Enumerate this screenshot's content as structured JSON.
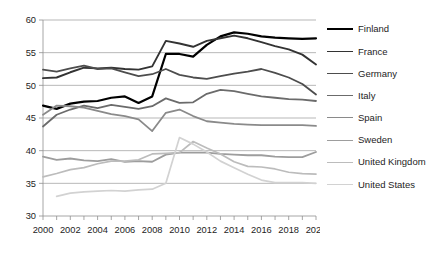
{
  "chart_data": {
    "type": "line",
    "title": "",
    "subtitle": "",
    "xlabel": "",
    "ylabel": "",
    "xlim": [
      2000,
      2020
    ],
    "ylim": [
      30,
      60
    ],
    "yticks": [
      30,
      35,
      40,
      45,
      50,
      55,
      60
    ],
    "xticks": [
      2000,
      2001,
      2002,
      2003,
      2004,
      2005,
      2006,
      2007,
      2008,
      2009,
      2010,
      2011,
      2012,
      2013,
      2014,
      2015,
      2016,
      2017,
      2018,
      2019,
      2020
    ],
    "xtick_labels": [
      "2000",
      "2002",
      "2004",
      "2006",
      "2008",
      "2010",
      "2012",
      "2014",
      "2016",
      "2018",
      "2020"
    ],
    "grid": "horizontal",
    "legend_position": "right",
    "x": [
      2000,
      2001,
      2002,
      2003,
      2004,
      2005,
      2006,
      2007,
      2008,
      2009,
      2010,
      2011,
      2012,
      2013,
      2014,
      2015,
      2016,
      2017,
      2018,
      2019,
      2020
    ],
    "series": [
      {
        "name": "Finland",
        "color": "#000000",
        "width": 2.2,
        "values": [
          46.9,
          46.4,
          47.2,
          47.5,
          47.6,
          48.1,
          48.3,
          47.3,
          48.3,
          54.8,
          54.8,
          54.4,
          56.2,
          57.5,
          58.1,
          57.9,
          57.5,
          57.3,
          57.2,
          57.1,
          57.2
        ]
      },
      {
        "name": "France",
        "color": "#333333",
        "width": 1.9,
        "values": [
          51.1,
          51.2,
          52.0,
          52.7,
          52.6,
          52.7,
          52.5,
          52.4,
          52.9,
          56.8,
          56.4,
          55.9,
          56.8,
          57.2,
          57.6,
          57.2,
          56.6,
          56.0,
          55.5,
          54.7,
          53.2
        ]
      },
      {
        "name": "Germany",
        "color": "#4d4d4d",
        "width": 1.8,
        "values": [
          52.4,
          52.1,
          52.6,
          53.0,
          52.5,
          52.6,
          52.0,
          51.4,
          51.7,
          52.5,
          51.6,
          51.2,
          51.0,
          51.4,
          51.8,
          52.1,
          52.5,
          51.9,
          51.2,
          50.2,
          48.6
        ]
      },
      {
        "name": "Italy",
        "color": "#6b6b6b",
        "width": 1.8,
        "values": [
          43.7,
          45.5,
          46.3,
          46.9,
          46.5,
          47.0,
          46.7,
          46.4,
          46.8,
          48.0,
          47.3,
          47.4,
          48.7,
          49.3,
          49.1,
          48.7,
          48.3,
          48.1,
          47.9,
          47.8,
          47.6
        ]
      },
      {
        "name": "Spain",
        "color": "#8a8a8a",
        "width": 1.8,
        "values": [
          45.5,
          46.9,
          46.8,
          46.6,
          46.1,
          45.6,
          45.3,
          44.8,
          43.0,
          45.8,
          46.3,
          45.3,
          44.5,
          44.3,
          44.1,
          44.0,
          43.9,
          43.9,
          43.9,
          43.9,
          43.8
        ]
      },
      {
        "name": "Sweden",
        "color": "#9d9d9d",
        "width": 1.8,
        "values": [
          39.1,
          38.6,
          38.8,
          38.5,
          38.4,
          38.7,
          38.3,
          38.4,
          38.3,
          39.4,
          39.7,
          39.7,
          39.7,
          39.5,
          39.4,
          39.3,
          39.3,
          39.1,
          39.0,
          39.0,
          39.8
        ]
      },
      {
        "name": "United Kingdom",
        "color": "#bcbcbc",
        "width": 1.7,
        "values": [
          36.0,
          36.5,
          37.1,
          37.4,
          38.0,
          38.4,
          38.4,
          38.6,
          39.5,
          39.6,
          39.7,
          41.4,
          40.4,
          39.5,
          38.3,
          37.6,
          37.5,
          37.2,
          36.7,
          36.5,
          36.4
        ]
      },
      {
        "name": "United States",
        "color": "#d2d2d2",
        "width": 1.7,
        "values": [
          null,
          33.0,
          33.5,
          33.7,
          33.8,
          33.9,
          33.8,
          34.0,
          34.1,
          35.0,
          42.0,
          41.0,
          39.8,
          38.4,
          37.4,
          36.4,
          35.5,
          35.1,
          35.1,
          35.1,
          35.0
        ]
      }
    ]
  },
  "legend": {
    "items": [
      {
        "label": "Finland"
      },
      {
        "label": "France"
      },
      {
        "label": "Germany"
      },
      {
        "label": "Italy"
      },
      {
        "label": "Spain"
      },
      {
        "label": "Sweden"
      },
      {
        "label": "United Kingdom"
      },
      {
        "label": "United States"
      }
    ]
  }
}
